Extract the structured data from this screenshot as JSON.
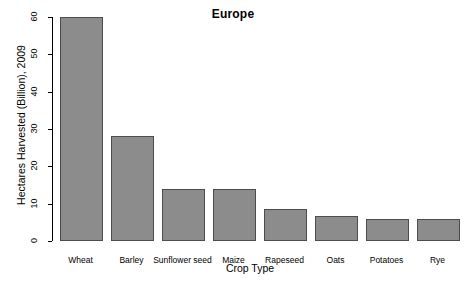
{
  "chart_data": {
    "type": "bar",
    "title": "Europe",
    "xlabel": "Crop Type",
    "ylabel": "Hectares Harvested (Billion), 2009",
    "categories": [
      "Wheat",
      "Barley",
      "Sunflower seed",
      "Maize",
      "Rapeseed",
      "Oats",
      "Potatoes",
      "Rye"
    ],
    "values": [
      60,
      28,
      14,
      14,
      8.6,
      6.6,
      6,
      6
    ],
    "ylim": [
      0,
      60
    ],
    "yticks": [
      0,
      10,
      20,
      30,
      40,
      50,
      60
    ],
    "ytick_labels": [
      "0",
      "10",
      "20",
      "30",
      "40",
      "50",
      "60"
    ],
    "grid": false,
    "legend": "none",
    "bar_fill_color": "#8c8c8c",
    "bar_border_color": "#4d4d4d",
    "background_color": "#ffffff",
    "axis_color": "#000000"
  }
}
